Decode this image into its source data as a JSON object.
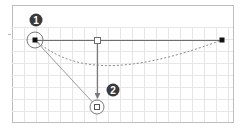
{
  "diagram": {
    "type": "bezier-curve-editing-illustration",
    "frame": {
      "x": 12,
      "y": 5,
      "width": 221,
      "height": 117,
      "border_color": "#bdbdbd",
      "background": "#ffffff"
    },
    "grid": {
      "top": 27,
      "spacing": 12,
      "color": "#e6e6e6"
    },
    "segment": {
      "start": {
        "x": 35,
        "y": 40
      },
      "end": {
        "x": 222,
        "y": 40
      },
      "midpoint_handle": {
        "x": 97,
        "y": 40
      },
      "color": "#6e6e6e"
    },
    "start_point_highlight": {
      "cx": 35,
      "cy": 40,
      "r": 8
    },
    "drag_arrow": {
      "from": {
        "x": 97,
        "y": 44
      },
      "to": {
        "x": 97,
        "y": 100
      },
      "color": "#7a7a7a"
    },
    "dragged_handle": {
      "cx": 97,
      "cy": 107,
      "r": 7
    },
    "tangent_line": {
      "from": {
        "x": 35,
        "y": 40
      },
      "to": {
        "x": 97,
        "y": 107
      },
      "color": "#9a9a9a"
    },
    "curve_preview": {
      "path": "M35,40 C70,70 120,78 222,40",
      "style": "dashed",
      "color": "#8a8a8a"
    },
    "badges": [
      {
        "label": "1",
        "cx": 36,
        "cy": 20,
        "color": "#3a3a3a"
      },
      {
        "label": "2",
        "cx": 113,
        "cy": 90,
        "color": "#3a3a3a"
      }
    ],
    "left_tick": {
      "x": 8,
      "y": 34
    }
  }
}
